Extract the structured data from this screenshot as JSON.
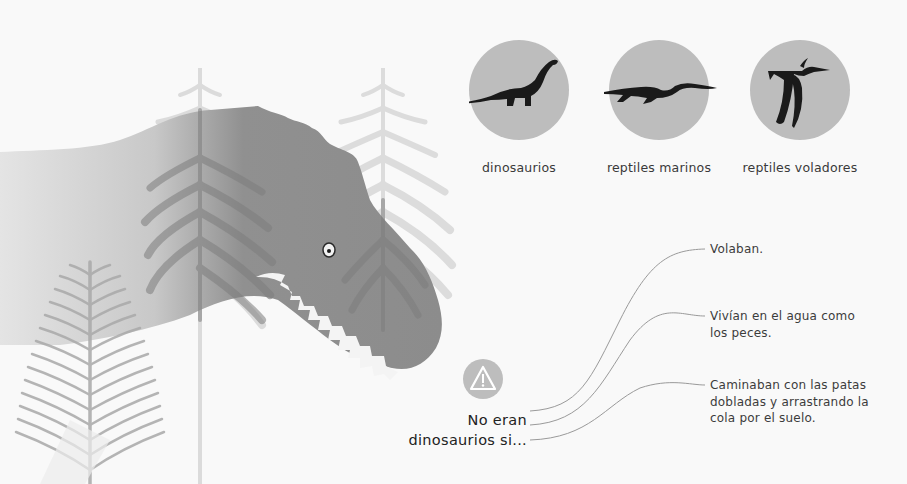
{
  "categories": [
    {
      "label": "dinosaurios",
      "icon": "sauropod-icon"
    },
    {
      "label": "reptiles marinos",
      "icon": "plesiosaur-icon"
    },
    {
      "label": "reptiles voladores",
      "icon": "pterosaur-icon"
    }
  ],
  "question": {
    "line1": "No eran",
    "line2": "dinosaurios si...",
    "icon": "warning-icon"
  },
  "answers": [
    {
      "text": "Volaban."
    },
    {
      "text": "Vivían en el agua como los peces."
    },
    {
      "text": "Caminaban con las patas dobladas y arrastrando la cola por el suelo."
    }
  ],
  "colors": {
    "background": "#f9f9f9",
    "circle": "#bdbdbd",
    "dinosaur": "#8f8f8f",
    "silhouette": "#1a1a1a",
    "connector_line": "#9a9a9a",
    "fern_light": "#d6d6d6",
    "fern_mid": "#a8a8a8"
  }
}
